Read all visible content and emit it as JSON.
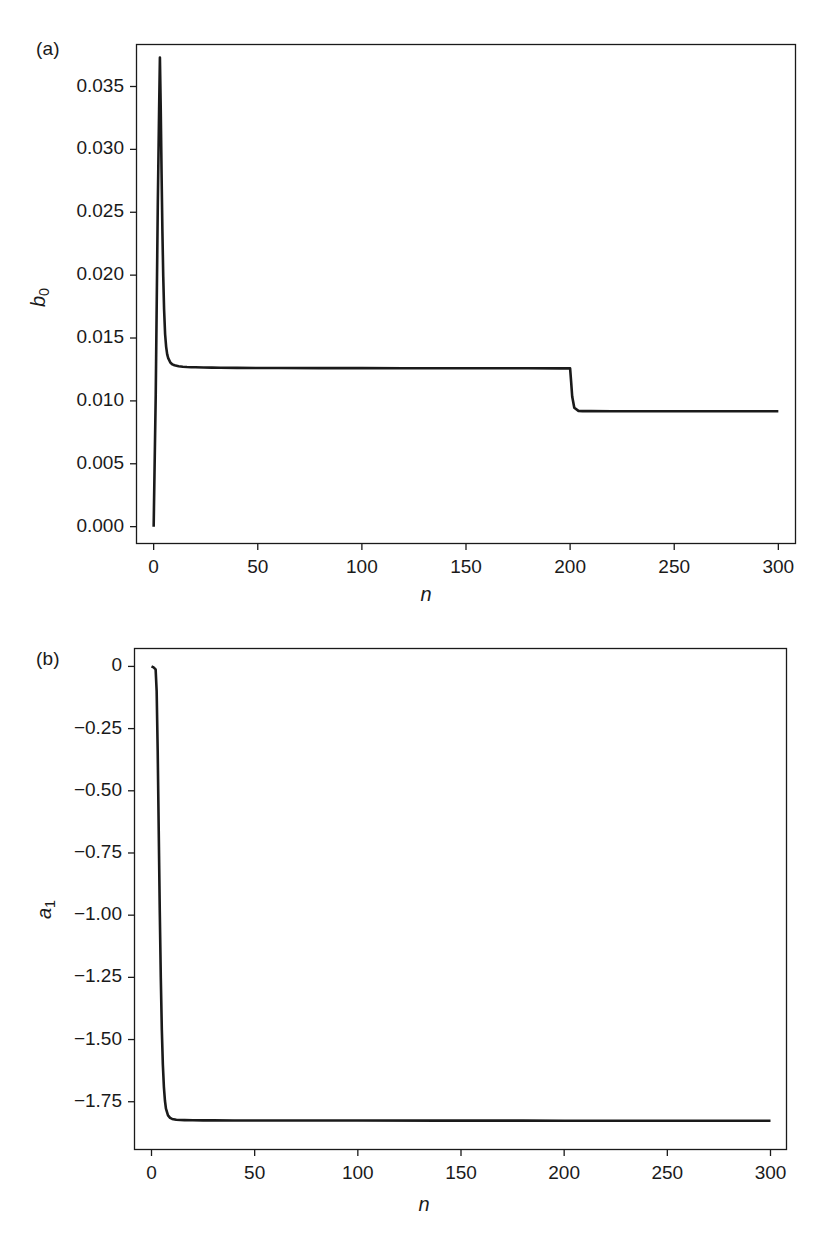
{
  "figure": {
    "background": "#ffffff",
    "line_color": "#1a1a1a",
    "axis_color": "#1a1a1a"
  },
  "panels": [
    {
      "tag": "(a)",
      "name": "panel-a",
      "ylabel_main": "b",
      "ylabel_sub": "0",
      "xlabel": "n",
      "ytick_labels": [
        "0.035",
        "0.030",
        "0.025",
        "0.020",
        "0.015",
        "0.010",
        "0.005",
        "0.000"
      ],
      "xtick_labels": [
        "0",
        "50",
        "100",
        "150",
        "200",
        "250",
        "300"
      ]
    },
    {
      "tag": "(b)",
      "name": "panel-b",
      "ylabel_main": "a",
      "ylabel_sub": "1",
      "xlabel": "n",
      "ytick_labels": [
        "0",
        "−0.25",
        "−0.50",
        "−0.75",
        "−1.00",
        "−1.25",
        "−1.50",
        "−1.75"
      ],
      "xtick_labels": [
        "0",
        "50",
        "100",
        "150",
        "200",
        "250",
        "300"
      ]
    }
  ],
  "chart_data": [
    {
      "type": "line",
      "panel": "(a)",
      "title": "",
      "xlabel": "n",
      "ylabel": "b_0",
      "xlim": [
        -8,
        308
      ],
      "ylim": [
        -0.0013,
        0.0383
      ],
      "xticks": [
        0,
        50,
        100,
        150,
        200,
        250,
        300
      ],
      "yticks": [
        0.0,
        0.005,
        0.01,
        0.015,
        0.02,
        0.025,
        0.03,
        0.035
      ],
      "grid": false,
      "legend": null,
      "annotations": [
        "(a)"
      ],
      "description": "Adaptive filter coefficient b0 versus iteration n: starts at 0, spikes to 0.0373 near n=3, decays to a plateau near 0.0126, then steps down at n=200 to a plateau near 0.0092.",
      "x": [
        0,
        1,
        2,
        2.6,
        3.0,
        3.4,
        3.8,
        4.2,
        4.6,
        5.0,
        5.5,
        6,
        6.5,
        7,
        8,
        9,
        10,
        12,
        14,
        16,
        18,
        20,
        24,
        28,
        32,
        40,
        50,
        60,
        80,
        100,
        120,
        140,
        160,
        180,
        195,
        199,
        199.5,
        200,
        200.5,
        201,
        202,
        204,
        206,
        210,
        220,
        240,
        260,
        280,
        300
      ],
      "y": [
        0.0,
        0.0105,
        0.0258,
        0.033,
        0.0373,
        0.0332,
        0.0281,
        0.0235,
        0.0199,
        0.0173,
        0.0153,
        0.0143,
        0.0137,
        0.0134,
        0.01305,
        0.0129,
        0.01283,
        0.01275,
        0.01271,
        0.01269,
        0.01268,
        0.01267,
        0.012655,
        0.012645,
        0.012638,
        0.012628,
        0.01262,
        0.012615,
        0.012608,
        0.012603,
        0.0126,
        0.012597,
        0.012594,
        0.012591,
        0.012589,
        0.012588,
        0.012588,
        0.012588,
        0.0115,
        0.01035,
        0.00945,
        0.00921,
        0.00919,
        0.009185,
        0.009182,
        0.00918,
        0.009178,
        0.009177,
        0.009176
      ]
    },
    {
      "type": "line",
      "panel": "(b)",
      "title": "",
      "xlabel": "n",
      "ylabel": "a_1",
      "xlim": [
        -8,
        308
      ],
      "ylim": [
        -1.94,
        0.07
      ],
      "xticks": [
        0,
        50,
        100,
        150,
        200,
        250,
        300
      ],
      "yticks": [
        0.0,
        -0.25,
        -0.5,
        -0.75,
        -1.0,
        -1.25,
        -1.5,
        -1.75
      ],
      "grid": false,
      "legend": null,
      "annotations": [
        "(b)"
      ],
      "description": "Adaptive filter coefficient a1 versus iteration n: starts at 0, falls steeply between n=2 and n=8 to a plateau near -1.82 which persists to n=300.",
      "x": [
        0,
        1,
        2,
        2.5,
        3,
        3.5,
        4,
        4.5,
        5,
        5.5,
        6,
        6.5,
        7,
        8,
        9,
        10,
        12,
        14,
        16,
        20,
        25,
        30,
        40,
        50,
        70,
        100,
        140,
        180,
        200,
        220,
        250,
        280,
        300
      ],
      "y": [
        0.0,
        -0.004,
        -0.012,
        -0.1,
        -0.34,
        -0.66,
        -0.98,
        -1.25,
        -1.46,
        -1.6,
        -1.69,
        -1.745,
        -1.778,
        -1.805,
        -1.815,
        -1.819,
        -1.8225,
        -1.8235,
        -1.824,
        -1.8245,
        -1.8248,
        -1.825,
        -1.8252,
        -1.8253,
        -1.8255,
        -1.8257,
        -1.8259,
        -1.8261,
        -1.8262,
        -1.8263,
        -1.8264,
        -1.8265,
        -1.8266
      ]
    }
  ]
}
